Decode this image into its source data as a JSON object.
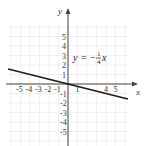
{
  "chart_data": {
    "type": "line",
    "title": "",
    "xlabel": "x",
    "ylabel": "y",
    "xlim": [
      -6,
      6
    ],
    "ylim": [
      -6,
      6
    ],
    "grid": true,
    "equation_label": {
      "lhs": "y",
      "equals": "=",
      "sign": "−",
      "numerator": "1",
      "denominator": "4",
      "var": "x"
    },
    "series": [
      {
        "name": "y = -1/4 x",
        "x": [
          -6.3,
          6.3
        ],
        "y": [
          1.575,
          -1.575
        ],
        "color": "#1a1a1a"
      }
    ],
    "x_ticks": [
      "-5",
      "-4",
      "-3",
      "-2",
      "-1",
      "1",
      "4",
      "5"
    ],
    "x_tick_values": [
      -5,
      -4,
      -3,
      -2,
      -1,
      1,
      4,
      5
    ],
    "y_ticks": [
      "5",
      "4",
      "3",
      "2",
      "1",
      "-1",
      "-2",
      "-3",
      "-4",
      "-5"
    ],
    "y_tick_values": [
      5,
      4,
      3,
      2,
      1,
      -1,
      -2,
      -3,
      -4,
      -5
    ]
  },
  "colors": {
    "grid": "#e6e6e6",
    "axis": "#444444",
    "line": "#1a1a1a"
  }
}
